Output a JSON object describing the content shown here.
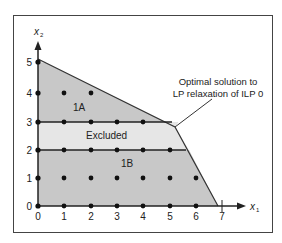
{
  "diagram": {
    "type": "ilp-branching-feasible-region",
    "axes": {
      "x_label": "x",
      "x_sub": "1",
      "y_label": "x",
      "y_sub": "2",
      "x_ticks": [
        "0",
        "1",
        "2",
        "3",
        "4",
        "5",
        "6",
        "7"
      ],
      "y_ticks": [
        "0",
        "1",
        "2",
        "3",
        "4",
        "5"
      ]
    },
    "regions": {
      "upper": "1A",
      "band": "Excluded",
      "lower": "1B"
    },
    "annotation": {
      "line1": "Optimal solution to",
      "line2": "LP relaxation of ILP 0"
    },
    "colors": {
      "region_fill": "#c8c8c8",
      "band_fill": "#e4e4e4",
      "line": "#333333"
    }
  }
}
